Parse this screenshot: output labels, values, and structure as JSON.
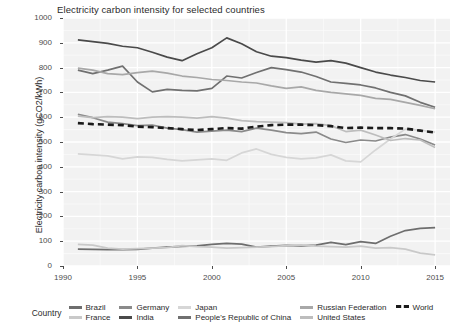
{
  "chart_data": {
    "type": "line",
    "title": "Electricity carbon intensity for selected countries",
    "xlabel": "",
    "ylabel": "Electricity carbon intensity (gCO2/kWh)",
    "xlim": [
      1990,
      2016
    ],
    "ylim": [
      0,
      1000
    ],
    "xticks": [
      1990,
      1995,
      2000,
      2005,
      2010,
      2015
    ],
    "yticks": [
      0,
      100,
      200,
      300,
      400,
      500,
      600,
      700,
      800,
      900,
      1000
    ],
    "grid": true,
    "legend_position": "bottom",
    "legend_title": "Country",
    "x": [
      1991,
      1992,
      1993,
      1994,
      1995,
      1996,
      1997,
      1998,
      1999,
      2000,
      2001,
      2002,
      2003,
      2004,
      2005,
      2006,
      2007,
      2008,
      2009,
      2010,
      2011,
      2012,
      2013,
      2014,
      2015
    ],
    "series": [
      {
        "name": "Brazil",
        "color": "#6e6e6e",
        "dash": "none",
        "values": [
          68,
          67,
          66,
          66,
          67,
          72,
          76,
          79,
          81,
          87,
          91,
          88,
          76,
          80,
          83,
          81,
          84,
          95,
          86,
          98,
          91,
          120,
          143,
          152,
          155
        ]
      },
      {
        "name": "France",
        "color": "#c9c9c9",
        "dash": "none",
        "values": [
          87,
          84,
          72,
          68,
          70,
          72,
          74,
          82,
          78,
          76,
          72,
          74,
          76,
          78,
          82,
          85,
          80,
          78,
          76,
          80,
          72,
          74,
          68,
          52,
          45
        ]
      },
      {
        "name": "Germany",
        "color": "#8a8a8a",
        "dash": "none",
        "values": [
          612,
          598,
          580,
          574,
          566,
          568,
          556,
          550,
          540,
          544,
          548,
          542,
          556,
          548,
          538,
          534,
          540,
          512,
          498,
          508,
          504,
          520,
          530,
          512,
          488
        ]
      },
      {
        "name": "India",
        "color": "#4a4a4a",
        "dash": "none",
        "values": [
          912,
          905,
          898,
          886,
          880,
          862,
          842,
          828,
          856,
          880,
          920,
          896,
          864,
          846,
          840,
          830,
          822,
          828,
          818,
          800,
          782,
          770,
          760,
          748,
          742
        ]
      },
      {
        "name": "Japan",
        "color": "#d6d6d6",
        "dash": "none",
        "values": [
          452,
          448,
          444,
          432,
          440,
          438,
          430,
          424,
          428,
          432,
          426,
          456,
          472,
          450,
          438,
          432,
          436,
          448,
          424,
          420,
          468,
          512,
          552,
          548,
          540
        ]
      },
      {
        "name": "People's Republic of China",
        "color": "#707070",
        "dash": "none",
        "values": [
          790,
          776,
          790,
          806,
          742,
          702,
          712,
          708,
          706,
          716,
          766,
          758,
          780,
          800,
          792,
          782,
          764,
          742,
          736,
          730,
          718,
          700,
          686,
          660,
          640
        ]
      },
      {
        "name": "Russian Federation",
        "color": "#a8a8a8",
        "dash": "none",
        "values": [
          798,
          790,
          776,
          772,
          780,
          786,
          778,
          766,
          760,
          752,
          748,
          742,
          738,
          726,
          716,
          722,
          708,
          700,
          694,
          688,
          676,
          672,
          660,
          648,
          634
        ]
      },
      {
        "name": "United States",
        "color": "#bdbdbd",
        "dash": "none",
        "values": [
          604,
          598,
          602,
          600,
          594,
          600,
          602,
          600,
          596,
          602,
          596,
          586,
          582,
          580,
          578,
          572,
          574,
          566,
          542,
          548,
          528,
          506,
          514,
          508,
          478
        ]
      },
      {
        "name": "World",
        "color": "#1a1a1a",
        "dash": "dashed",
        "values": [
          576,
          572,
          570,
          568,
          562,
          560,
          556,
          552,
          548,
          552,
          556,
          554,
          562,
          568,
          570,
          570,
          568,
          564,
          556,
          558,
          556,
          556,
          554,
          546,
          538
        ]
      }
    ]
  },
  "legend": {
    "title": "Country",
    "items": [
      {
        "label": "Brazil"
      },
      {
        "label": "Germany"
      },
      {
        "label": "Japan"
      },
      {
        "label": "Russian Federation"
      },
      {
        "label": "World"
      },
      {
        "label": "France"
      },
      {
        "label": "India"
      },
      {
        "label": "People's Republic of China"
      },
      {
        "label": "United States"
      }
    ]
  },
  "theme": {
    "panel_bg": "#f2f2f2",
    "grid_major": "#ffffff",
    "grid_minor": "#fafafa",
    "text": "#2b2b2b",
    "tick_text": "#4d4d4d"
  }
}
